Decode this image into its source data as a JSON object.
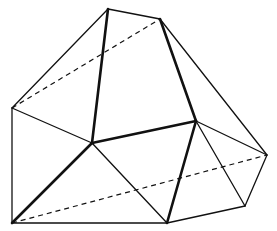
{
  "diagram": {
    "type": "polyhedron-wireframe",
    "width": 277,
    "height": 231,
    "colors": {
      "line": "#111111",
      "background": "#ffffff"
    },
    "vertices": {
      "A": [
        108,
        9
      ],
      "B": [
        160,
        19
      ],
      "C": [
        12,
        108
      ],
      "D": [
        92,
        143
      ],
      "E": [
        196,
        121
      ],
      "F": [
        267,
        155
      ],
      "G": [
        12,
        223
      ],
      "H": [
        167,
        223
      ],
      "I": [
        245,
        206
      ]
    },
    "edges": [
      {
        "from": "A",
        "to": "B",
        "style": "thin"
      },
      {
        "from": "A",
        "to": "C",
        "style": "thin"
      },
      {
        "from": "C",
        "to": "G",
        "style": "thin"
      },
      {
        "from": "G",
        "to": "H",
        "style": "thin"
      },
      {
        "from": "H",
        "to": "I",
        "style": "thin"
      },
      {
        "from": "I",
        "to": "F",
        "style": "thin"
      },
      {
        "from": "B",
        "to": "F",
        "style": "thin"
      },
      {
        "from": "C",
        "to": "D",
        "style": "thin"
      },
      {
        "from": "D",
        "to": "H",
        "style": "thin"
      },
      {
        "from": "E",
        "to": "I",
        "style": "thin"
      },
      {
        "from": "E",
        "to": "F",
        "style": "thin"
      },
      {
        "from": "A",
        "to": "D",
        "style": "thick"
      },
      {
        "from": "D",
        "to": "G",
        "style": "thick"
      },
      {
        "from": "D",
        "to": "E",
        "style": "thick"
      },
      {
        "from": "B",
        "to": "E",
        "style": "thick"
      },
      {
        "from": "E",
        "to": "H",
        "style": "thick"
      },
      {
        "from": "C",
        "to": "B",
        "style": "dashed"
      },
      {
        "from": "G",
        "to": "F",
        "style": "dashed"
      }
    ]
  }
}
